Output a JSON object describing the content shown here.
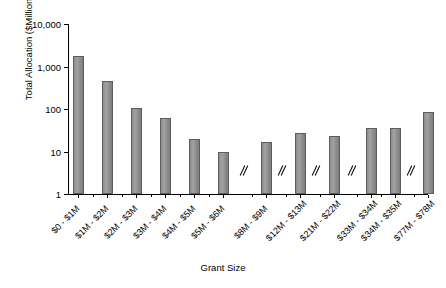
{
  "chart_data": {
    "type": "bar",
    "title": "",
    "xlabel": "Grant Size",
    "ylabel": "Total Allocation ($Millions)",
    "yscale": "log",
    "ylim": [
      1,
      10000
    ],
    "ytick_labels": [
      "1",
      "10",
      "100",
      "1,000",
      "10,000"
    ],
    "ytick_values": [
      1,
      10,
      100,
      1000,
      10000
    ],
    "grid": false,
    "legend": false,
    "axis_breaks": [
      "after $5M - $6M",
      "after $8M - $9M",
      "after $12M - $13M",
      "after $21M - $22M",
      "after $34M - $35M"
    ],
    "categories": [
      "$0 - $1M",
      "$1M - $2M",
      "$2M - $3M",
      "$3M - $4M",
      "$4M - $5M",
      "$5M - $6M",
      "$8M - $9M",
      "$12M - $13M",
      "$21M - $22M",
      "$33M - $34M",
      "$34M - $35M",
      "$77M - $78M"
    ],
    "values": [
      1800,
      450,
      105,
      60,
      20,
      10,
      17,
      27,
      23,
      35,
      35,
      85
    ]
  }
}
